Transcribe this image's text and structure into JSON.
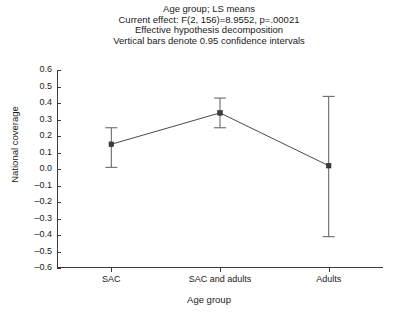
{
  "chart_data": {
    "type": "line",
    "title": "Age group; LS means",
    "title_lines": [
      "Age group; LS means",
      "Current effect: F(2, 156)=8.9552, p=.00021",
      "Effective hypothesis decomposition",
      "Vertical bars denote 0.95 confidence intervals"
    ],
    "xlabel": "Age group",
    "ylabel": "National coverage",
    "categories": [
      "SAC",
      "SAC and adults",
      "Adults"
    ],
    "values": [
      0.15,
      0.34,
      0.02
    ],
    "ci_lower": [
      0.01,
      0.25,
      -0.41
    ],
    "ci_upper": [
      0.25,
      0.43,
      0.44
    ],
    "error_bar_label": "0.95 confidence intervals",
    "ylim": [
      -0.6,
      0.6
    ],
    "ytick_step": 0.1,
    "ytick_labels": [
      "0.6",
      "0.5",
      "0.4",
      "0.3",
      "0.2",
      "0.1",
      "0.0",
      "–0.1",
      "–0.2",
      "–0.3",
      "–0.4",
      "–0.5",
      "–0.6"
    ],
    "ytick_values": [
      0.6,
      0.5,
      0.4,
      0.3,
      0.2,
      0.1,
      0.0,
      -0.1,
      -0.2,
      -0.3,
      -0.4,
      -0.5,
      -0.6
    ],
    "grid": false,
    "legend": false,
    "marker_style": "square",
    "line_color": "#4a4a4a",
    "marker_color": "#3d3d3d",
    "error_color": "#6b6b6b",
    "background_color": "#ffffff",
    "axis_color": "#3a3a3a"
  }
}
